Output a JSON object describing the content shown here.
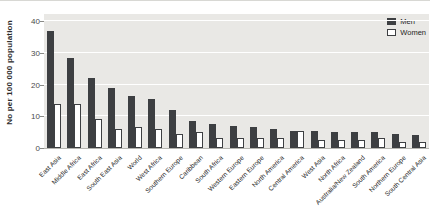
{
  "chart_data": {
    "type": "bar",
    "title": "",
    "ylabel": "No per 100 000 population",
    "xlabel": "",
    "ylim": [
      0,
      40
    ],
    "yticks": [
      0,
      10,
      20,
      30,
      40
    ],
    "grid": true,
    "legend_position": "top-right",
    "plot_background": "#e9e8e5",
    "gridline_color": "#ffffff",
    "categories": [
      "East Asia",
      "Middle Africa",
      "East Africa",
      "South East Asia",
      "World",
      "West Africa",
      "Southern Europe",
      "Caribbean",
      "South Africa",
      "Western Europe",
      "Eastern Europe",
      "North America",
      "Central America",
      "West Asia",
      "North Africa",
      "Australia/New Zealand",
      "South America",
      "Northern Europe",
      "South Central Asia"
    ],
    "series": [
      {
        "name": "Men",
        "color": "#3d3f42",
        "values": [
          37,
          28.5,
          22,
          19,
          16.5,
          15.5,
          12,
          8.5,
          7.5,
          7,
          6.5,
          6,
          5.5,
          5.5,
          5,
          5,
          5,
          4.5,
          4
        ]
      },
      {
        "name": "Women",
        "color": "#ffffff",
        "values": [
          14,
          14,
          9,
          6,
          6.5,
          6,
          4.5,
          5,
          3,
          3,
          3,
          3,
          5.5,
          2.5,
          2.5,
          2.5,
          3,
          2,
          2
        ]
      }
    ]
  }
}
